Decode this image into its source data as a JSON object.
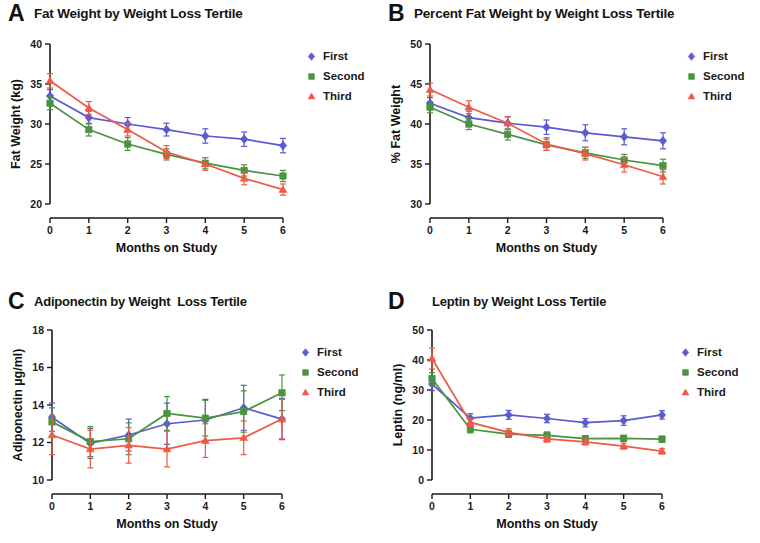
{
  "figure": {
    "panels": [
      {
        "letter": "A",
        "title": "Fat Weight by Weight Loss Tertile",
        "xlabel": "Months on Study",
        "ylabel": "Fat Weight (kg)"
      },
      {
        "letter": "B",
        "title": "Percent Fat Weight by Weight Loss Tertile",
        "xlabel": "Months on Study",
        "ylabel": "% Fat Weight"
      },
      {
        "letter": "C",
        "title": "Adiponectin by Weight  Loss Tertile",
        "xlabel": "Months on Study",
        "ylabel": "Adiponectin  µg/ml)"
      },
      {
        "letter": "D",
        "title": "Leptin by Weight Loss Tertile",
        "xlabel": "Months on Study",
        "ylabel": "Leptin (ng/ml)"
      }
    ],
    "legend": {
      "items": [
        {
          "label": "First",
          "color": "#5a5ad2",
          "marker": "diamond"
        },
        {
          "label": "Second",
          "color": "#4a9340",
          "marker": "square"
        },
        {
          "label": "Third",
          "color": "#ee5a45",
          "marker": "triangle"
        }
      ]
    },
    "colors": {
      "first": "#5a5ad2",
      "second": "#4a9340",
      "third": "#ee5a45",
      "axis": "#1a1a1a"
    }
  },
  "chart_data": [
    {
      "type": "line",
      "panel": "A",
      "title": "Fat Weight by Weight Loss Tertile",
      "xlabel": "Months on Study",
      "ylabel": "Fat Weight (kg)",
      "x": [
        0,
        1,
        2,
        3,
        4,
        5,
        6
      ],
      "xticklabels": [
        "0",
        "1",
        "2",
        "3",
        "4",
        "5",
        "6"
      ],
      "xlim": [
        0,
        6
      ],
      "ylim": [
        20,
        40
      ],
      "yticks": [
        20,
        25,
        30,
        35,
        40
      ],
      "yticklabels": [
        "20",
        "25",
        "30",
        "35",
        "40"
      ],
      "grid": false,
      "legend_position": "right",
      "series": [
        {
          "name": "First",
          "color": "#5a5ad2",
          "marker": "diamond",
          "values": [
            33.5,
            30.8,
            30.0,
            29.3,
            28.5,
            28.1,
            27.3
          ],
          "errors": [
            0.8,
            0.8,
            0.8,
            0.8,
            0.9,
            0.9,
            0.9
          ]
        },
        {
          "name": "Second",
          "color": "#4a9340",
          "marker": "square",
          "values": [
            32.6,
            29.3,
            27.5,
            26.2,
            25.1,
            24.2,
            23.5
          ],
          "errors": [
            0.8,
            0.8,
            0.8,
            0.7,
            0.7,
            0.7,
            0.7
          ]
        },
        {
          "name": "Third",
          "color": "#ee5a45",
          "marker": "triangle",
          "values": [
            35.4,
            32.0,
            29.3,
            26.5,
            25.0,
            23.2,
            21.8
          ],
          "errors": [
            0.9,
            0.8,
            0.8,
            0.8,
            0.8,
            0.8,
            0.7
          ]
        }
      ]
    },
    {
      "type": "line",
      "panel": "B",
      "title": "Percent Fat Weight by Weight Loss Tertile",
      "xlabel": "Months on Study",
      "ylabel": "% Fat Weight",
      "x": [
        0,
        1,
        2,
        3,
        4,
        5,
        6
      ],
      "xticklabels": [
        "0",
        "1",
        "2",
        "3",
        "4",
        "5",
        "6"
      ],
      "xlim": [
        0,
        6
      ],
      "ylim": [
        30,
        50
      ],
      "yticks": [
        30,
        35,
        40,
        45,
        50
      ],
      "yticklabels": [
        "30",
        "35",
        "40",
        "45",
        "50"
      ],
      "grid": false,
      "legend_position": "right",
      "series": [
        {
          "name": "First",
          "color": "#5a5ad2",
          "marker": "diamond",
          "values": [
            42.6,
            40.8,
            40.1,
            39.6,
            38.9,
            38.4,
            37.9
          ],
          "errors": [
            0.7,
            0.8,
            0.8,
            0.9,
            1.0,
            1.0,
            1.0
          ]
        },
        {
          "name": "Second",
          "color": "#4a9340",
          "marker": "square",
          "values": [
            42.1,
            40.0,
            38.7,
            37.4,
            36.4,
            35.5,
            34.8
          ],
          "errors": [
            0.7,
            0.7,
            0.7,
            0.7,
            0.7,
            0.7,
            0.8
          ]
        },
        {
          "name": "Third",
          "color": "#ee5a45",
          "marker": "triangle",
          "values": [
            44.3,
            42.1,
            40.1,
            37.5,
            36.3,
            34.9,
            33.4
          ],
          "errors": [
            0.8,
            0.8,
            0.8,
            0.8,
            0.8,
            0.9,
            0.9
          ]
        }
      ]
    },
    {
      "type": "line",
      "panel": "C",
      "title": "Adiponectin by Weight  Loss Tertile",
      "xlabel": "Months on Study",
      "ylabel": "Adiponectin  µg/ml)",
      "x": [
        0,
        1,
        2,
        3,
        4,
        5,
        6
      ],
      "xticklabels": [
        "0",
        "1",
        "2",
        "3",
        "4",
        "5",
        "6"
      ],
      "xlim": [
        0,
        6
      ],
      "ylim": [
        10,
        18
      ],
      "yticks": [
        10,
        12,
        14,
        16,
        18
      ],
      "yticklabels": [
        "10",
        "12",
        "14",
        "16",
        "18"
      ],
      "grid": false,
      "legend_position": "right",
      "series": [
        {
          "name": "First",
          "color": "#5a5ad2",
          "marker": "diamond",
          "values": [
            13.35,
            11.95,
            12.4,
            13.0,
            13.2,
            13.85,
            13.25
          ],
          "errors": [
            0.75,
            0.8,
            0.85,
            1.1,
            1.1,
            1.2,
            1.1
          ]
        },
        {
          "name": "Second",
          "color": "#4a9340",
          "marker": "square",
          "values": [
            13.1,
            12.05,
            12.2,
            13.55,
            13.3,
            13.65,
            14.65
          ],
          "errors": [
            0.75,
            0.8,
            0.85,
            0.9,
            0.95,
            1.1,
            0.95
          ]
        },
        {
          "name": "Third",
          "color": "#ee5a45",
          "marker": "triangle",
          "values": [
            12.4,
            11.65,
            11.85,
            11.65,
            12.1,
            12.25,
            13.25
          ],
          "errors": [
            1.05,
            1.0,
            0.95,
            0.95,
            0.9,
            0.9,
            1.05
          ]
        }
      ]
    },
    {
      "type": "line",
      "panel": "D",
      "title": "Leptin by Weight Loss Tertile",
      "xlabel": "Months on Study",
      "ylabel": "Leptin (ng/ml)",
      "x": [
        0,
        1,
        2,
        3,
        4,
        5,
        6
      ],
      "xticklabels": [
        "0",
        "1",
        "2",
        "3",
        "4",
        "5",
        "6"
      ],
      "xlim": [
        0,
        50
      ],
      "ylim": [
        0,
        50
      ],
      "yticks": [
        0,
        10,
        20,
        30,
        40,
        50
      ],
      "yticklabels": [
        "0",
        "10",
        "20",
        "30",
        "40",
        "50"
      ],
      "grid": false,
      "legend_position": "right",
      "series": [
        {
          "name": "First",
          "color": "#5a5ad2",
          "marker": "diamond",
          "values": [
            32.0,
            20.6,
            21.7,
            20.5,
            19.1,
            19.8,
            21.7
          ],
          "errors": [
            2.2,
            1.5,
            1.5,
            1.4,
            1.4,
            1.6,
            1.4
          ]
        },
        {
          "name": "Second",
          "color": "#4a9340",
          "marker": "square",
          "values": [
            33.8,
            16.9,
            15.3,
            14.9,
            13.8,
            13.9,
            13.6
          ],
          "errors": [
            2.0,
            1.2,
            1.1,
            1.1,
            1.0,
            1.0,
            1.0
          ]
        },
        {
          "name": "Third",
          "color": "#ee5a45",
          "marker": "triangle",
          "values": [
            40.5,
            19.2,
            15.9,
            13.7,
            12.7,
            11.3,
            9.6
          ],
          "errors": [
            3.5,
            1.4,
            1.2,
            1.1,
            1.0,
            1.0,
            0.9
          ]
        }
      ]
    }
  ]
}
